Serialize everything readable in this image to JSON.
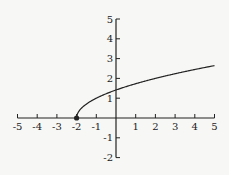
{
  "chart_data": {
    "type": "line",
    "title": "",
    "xlabel": "",
    "ylabel": "",
    "function": "y = sqrt(x + 2)",
    "xlim": [
      -5,
      5
    ],
    "ylim": [
      -2,
      5
    ],
    "grid": false,
    "x_ticks": [
      "-5",
      "-4",
      "-3",
      "-2",
      "-1",
      "1",
      "2",
      "3",
      "4",
      "5"
    ],
    "y_ticks": [
      "5",
      "4",
      "3",
      "2",
      "1",
      "-1",
      "-2"
    ],
    "series": [
      {
        "name": "curve",
        "x": [
          -2,
          -1.9,
          -1.75,
          -1.5,
          -1,
          0,
          1,
          2,
          3,
          4,
          5
        ],
        "y": [
          0,
          0.316,
          0.5,
          0.707,
          1,
          1.414,
          1.732,
          2,
          2.236,
          2.449,
          2.646
        ]
      }
    ],
    "annotations": [
      {
        "type": "filled-point",
        "x": -2,
        "y": 0
      }
    ]
  },
  "colors": {
    "background": "#f7f7f5",
    "ink": "#222222"
  }
}
